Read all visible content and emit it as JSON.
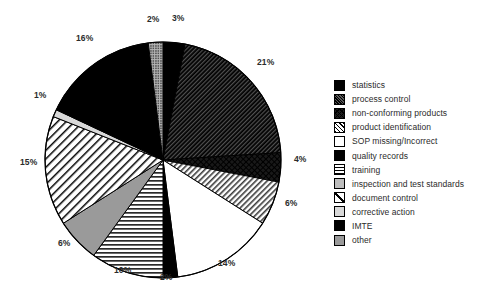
{
  "chart_data": {
    "type": "pie",
    "title": "",
    "subtitle": "",
    "xlabel": "",
    "ylabel": "",
    "legend_position": "right",
    "grid": false,
    "unit": "%",
    "categories": [
      "statistics",
      "process control",
      "non-conforming products",
      "product identification",
      "SOP missing/Incorrect",
      "quality records",
      "training",
      "inspection and test standards",
      "document control",
      "corrective action",
      "IMTE",
      "other"
    ],
    "values": [
      3,
      21,
      4,
      6,
      14,
      2,
      10,
      6,
      15,
      1,
      16,
      2
    ],
    "labels": [
      "3%",
      "21%",
      "4%",
      "6%",
      "14%",
      "2%",
      "10%",
      "6%",
      "15%",
      "1%",
      "16%",
      "2%"
    ],
    "slices": [
      {
        "label": "statistics",
        "value": 3,
        "text": "3%",
        "pattern": "solid-black",
        "start_angle": 0,
        "end_angle": 10.8
      },
      {
        "label": "process control",
        "value": 21,
        "text": "21%",
        "pattern": "diag-dense",
        "start_angle": 10.8,
        "end_angle": 86.4
      },
      {
        "label": "non-conforming products",
        "value": 4,
        "text": "4%",
        "pattern": "crosshatch-dark",
        "start_angle": 86.4,
        "end_angle": 100.8
      },
      {
        "label": "product identification",
        "value": 6,
        "text": "6%",
        "pattern": "diag-light",
        "start_angle": 100.8,
        "end_angle": 122.4
      },
      {
        "label": "SOP missing/Incorrect",
        "value": 14,
        "text": "14%",
        "pattern": "white",
        "start_angle": 122.4,
        "end_angle": 172.8
      },
      {
        "label": "quality records",
        "value": 2,
        "text": "2%",
        "pattern": "solid-black",
        "start_angle": 172.8,
        "end_angle": 180.0
      },
      {
        "label": "training",
        "value": 10,
        "text": "10%",
        "pattern": "horiz",
        "start_angle": 180.0,
        "end_angle": 216.0
      },
      {
        "label": "inspection and test standards",
        "value": 6,
        "text": "6%",
        "pattern": "gray",
        "start_angle": 216.0,
        "end_angle": 237.6
      },
      {
        "label": "document control",
        "value": 15,
        "text": "15%",
        "pattern": "diag-white",
        "start_angle": 237.6,
        "end_angle": 291.6
      },
      {
        "label": "corrective action",
        "value": 1,
        "text": "1%",
        "pattern": "lightgray",
        "start_angle": 291.6,
        "end_angle": 295.2
      },
      {
        "label": "IMTE",
        "value": 16,
        "text": "16%",
        "pattern": "solid-black",
        "start_angle": 295.2,
        "end_angle": 352.8
      },
      {
        "label": "other",
        "value": 2,
        "text": "2%",
        "pattern": "dots",
        "start_angle": 352.8,
        "end_angle": 360.0
      }
    ]
  },
  "pie": {
    "center_x": 163,
    "center_y": 160,
    "radius": 118,
    "pct_labels": [
      {
        "text": "2%",
        "x": 147,
        "y": 14
      },
      {
        "text": "3%",
        "x": 172,
        "y": 13
      },
      {
        "text": "21%",
        "x": 257,
        "y": 57
      },
      {
        "text": "4%",
        "x": 294,
        "y": 154
      },
      {
        "text": "6%",
        "x": 285,
        "y": 198
      },
      {
        "text": "14%",
        "x": 218,
        "y": 258
      },
      {
        "text": "2%",
        "x": 160,
        "y": 272
      },
      {
        "text": "10%",
        "x": 114,
        "y": 265
      },
      {
        "text": "6%",
        "x": 58,
        "y": 238
      },
      {
        "text": "15%",
        "x": 20,
        "y": 157
      },
      {
        "text": "1%",
        "x": 34,
        "y": 90
      },
      {
        "text": "16%",
        "x": 76,
        "y": 33
      }
    ]
  },
  "legend": {
    "items": [
      {
        "label": "statistics",
        "pattern": "solid-black"
      },
      {
        "label": "process control",
        "pattern": "diag-dense"
      },
      {
        "label": "non-conforming products",
        "pattern": "crosshatch-dark"
      },
      {
        "label": "product identification",
        "pattern": "diag-light"
      },
      {
        "label": "SOP missing/Incorrect",
        "pattern": "white"
      },
      {
        "label": "quality records",
        "pattern": "solid-black"
      },
      {
        "label": "training",
        "pattern": "horiz"
      },
      {
        "label": "inspection and test standards",
        "pattern": "dots"
      },
      {
        "label": "document control",
        "pattern": "slash-box"
      },
      {
        "label": "corrective action",
        "pattern": "lightgray"
      },
      {
        "label": "IMTE",
        "pattern": "solid-black"
      },
      {
        "label": "other",
        "pattern": "gray"
      }
    ]
  }
}
